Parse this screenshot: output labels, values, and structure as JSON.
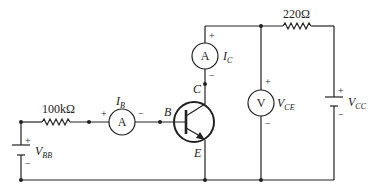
{
  "diagram": {
    "type": "circuit",
    "resistors": {
      "base": {
        "value": "100kΩ"
      },
      "collector": {
        "value": "220Ω"
      }
    },
    "sources": {
      "vbb": {
        "label": "V",
        "sub": "BB",
        "plus": "+",
        "minus": "−"
      },
      "vcc": {
        "label": "V",
        "sub": "CC",
        "plus": "+",
        "minus": "−"
      }
    },
    "meters": {
      "ib": {
        "symbol": "A",
        "label": "I",
        "sub": "B",
        "plus": "+",
        "minus": "−"
      },
      "ic": {
        "symbol": "A",
        "label": "I",
        "sub": "C",
        "plus": "+",
        "minus": "−"
      },
      "vce": {
        "symbol": "V",
        "label": "V",
        "sub": "CE",
        "plus": "+",
        "minus": "−"
      }
    },
    "transistor": {
      "type": "NPN",
      "base_label": "B",
      "collector_label": "C",
      "emitter_label": "E"
    }
  }
}
